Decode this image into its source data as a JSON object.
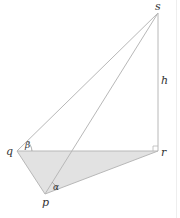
{
  "diagram": {
    "type": "3d-geometry",
    "points": {
      "s": {
        "label": "s",
        "x": 158,
        "y": 13
      },
      "r": {
        "label": "r",
        "x": 158,
        "y": 151
      },
      "q": {
        "label": "q",
        "x": 17,
        "y": 151
      },
      "p": {
        "label": "p",
        "x": 45,
        "y": 194
      }
    },
    "height_label": "h",
    "angles": {
      "beta": {
        "label": "β",
        "at": "q"
      },
      "alpha": {
        "label": "α",
        "at": "p"
      }
    },
    "right_angle_at": "r",
    "shaded_face": "pqr",
    "colors": {
      "line": "#b8b8b8",
      "fill": "#e2e2e2",
      "text": "#333333"
    }
  }
}
